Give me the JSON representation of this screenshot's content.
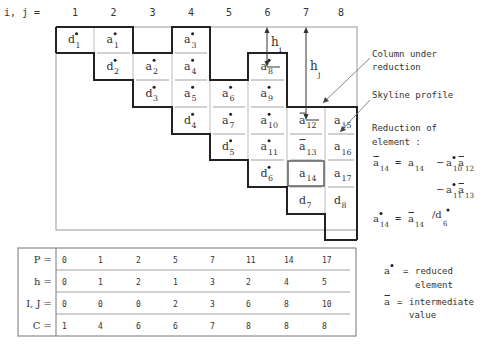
{
  "header": {
    "index_label": "i, j =",
    "columns": [
      "1",
      "2",
      "3",
      "4",
      "5",
      "6",
      "7",
      "8"
    ]
  },
  "matrix": {
    "cells": [
      {
        "col": 1,
        "row": 1,
        "base": "d",
        "sub": "1",
        "mark": "star"
      },
      {
        "col": 2,
        "row": 1,
        "base": "a",
        "sub": "1",
        "mark": "star"
      },
      {
        "col": 2,
        "row": 2,
        "base": "d",
        "sub": "2",
        "mark": "star"
      },
      {
        "col": 3,
        "row": 2,
        "base": "a",
        "sub": "2",
        "mark": "star"
      },
      {
        "col": 3,
        "row": 3,
        "base": "d",
        "sub": "3",
        "mark": "star"
      },
      {
        "col": 4,
        "row": 1,
        "base": "a",
        "sub": "3",
        "mark": "star"
      },
      {
        "col": 4,
        "row": 2,
        "base": "a",
        "sub": "4",
        "mark": "star"
      },
      {
        "col": 4,
        "row": 3,
        "base": "a",
        "sub": "5",
        "mark": "star"
      },
      {
        "col": 4,
        "row": 4,
        "base": "d",
        "sub": "4",
        "mark": "star"
      },
      {
        "col": 5,
        "row": 3,
        "base": "a",
        "sub": "6",
        "mark": "star"
      },
      {
        "col": 5,
        "row": 4,
        "base": "a",
        "sub": "7",
        "mark": "star"
      },
      {
        "col": 5,
        "row": 5,
        "base": "d",
        "sub": "5",
        "mark": "star"
      },
      {
        "col": 6,
        "row": 2,
        "base": "a",
        "sub": "8",
        "mark": "star"
      },
      {
        "col": 6,
        "row": 3,
        "base": "a",
        "sub": "9",
        "mark": "star"
      },
      {
        "col": 6,
        "row": 4,
        "base": "a",
        "sub": "10",
        "mark": "star"
      },
      {
        "col": 6,
        "row": 5,
        "base": "a",
        "sub": "11",
        "mark": "star"
      },
      {
        "col": 6,
        "row": 6,
        "base": "d",
        "sub": "6",
        "mark": "star"
      },
      {
        "col": 7,
        "row": 4,
        "base": "a",
        "sub": "12",
        "mark": "bar"
      },
      {
        "col": 7,
        "row": 5,
        "base": "a",
        "sub": "13",
        "mark": "bar"
      },
      {
        "col": 7,
        "row": 6,
        "base": "a",
        "sub": "14",
        "mark": "none"
      },
      {
        "col": 7,
        "row": 7,
        "base": "d",
        "sub": "7",
        "mark": "none"
      },
      {
        "col": 8,
        "row": 4,
        "base": "a",
        "sub": "15",
        "mark": "none"
      },
      {
        "col": 8,
        "row": 5,
        "base": "a",
        "sub": "16",
        "mark": "none"
      },
      {
        "col": 8,
        "row": 6,
        "base": "a",
        "sub": "17",
        "mark": "none"
      },
      {
        "col": 8,
        "row": 7,
        "base": "d",
        "sub": "8",
        "mark": "none"
      }
    ],
    "h_i_label": "h",
    "h_i_sub": "i",
    "h_j_label": "h",
    "h_j_sub": "j"
  },
  "annotations": {
    "column_under_reduction": [
      "Column under",
      "reduction"
    ],
    "skyline_profile": "Skyline profile",
    "reduction_title": [
      "Reduction of",
      "element :"
    ],
    "formula1": {
      "lhs": "a",
      "lhs_sub": "14",
      "eq": "=",
      "t1": "a",
      "t1_sub": "14",
      "minus": "−",
      "t2": "a",
      "t2_sub": "10",
      "t3": "a",
      "t3_sub": "12"
    },
    "formula2": {
      "minus": "−",
      "t2": "a",
      "t2_sub": "11",
      "t3": "a",
      "t3_sub": "13"
    },
    "formula3": {
      "lhs": "a",
      "lhs_sub": "14",
      "eq": "=",
      "num": "a",
      "num_sub": "14",
      "slash": "/d",
      "den_sub": "6"
    }
  },
  "legend": {
    "reduced": {
      "sym": "a",
      "eq": "=",
      "lines": [
        "reduced",
        "element"
      ]
    },
    "intermediate": {
      "sym": "a",
      "eq": "=",
      "lines": [
        "intermediate",
        "value"
      ]
    }
  },
  "table": {
    "rows": [
      {
        "label": "P =",
        "values": [
          "0",
          "1",
          "2",
          "5",
          "7",
          "11",
          "14",
          "17"
        ]
      },
      {
        "label": "h =",
        "values": [
          "0",
          "1",
          "2",
          "1",
          "3",
          "2",
          "4",
          "5"
        ]
      },
      {
        "label": "I, J =",
        "values": [
          "0",
          "0",
          "0",
          "2",
          "3",
          "6",
          "8",
          "10"
        ]
      },
      {
        "label": "C =",
        "values": [
          "1",
          "4",
          "6",
          "6",
          "7",
          "8",
          "8",
          "8"
        ]
      }
    ]
  }
}
